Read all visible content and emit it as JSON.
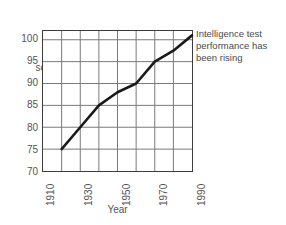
{
  "chart_data": {
    "type": "line",
    "title": "",
    "xlabel": "Year",
    "ylabel": "IQ score",
    "ylabel_line1": "IQ",
    "ylabel_line2": "score",
    "xlim": [
      1910,
      1990
    ],
    "ylim": [
      70,
      102
    ],
    "grid": true,
    "grid_x_step": 10,
    "grid_y_step": 5,
    "legend": "none",
    "x_ticks": [
      "1910",
      "1930",
      "1950",
      "1970",
      "1990"
    ],
    "x_tick_values": [
      1910,
      1930,
      1950,
      1970,
      1990
    ],
    "y_ticks": [
      "70",
      "75",
      "80",
      "85",
      "90",
      "95",
      "100"
    ],
    "y_tick_values": [
      70,
      75,
      80,
      85,
      90,
      95,
      100
    ],
    "x": [
      1920,
      1930,
      1940,
      1950,
      1960,
      1970,
      1980,
      1990
    ],
    "values": [
      75,
      80,
      85,
      88,
      90,
      95,
      97.5,
      101
    ],
    "series": [
      {
        "name": "IQ score",
        "color": "#1a1a1a",
        "x": [
          1920,
          1930,
          1940,
          1950,
          1960,
          1970,
          1980,
          1990
        ],
        "values": [
          75,
          80,
          85,
          88,
          90,
          95,
          97.5,
          101
        ]
      }
    ],
    "annotations": [
      {
        "text": "Intelligence test performance has been rising",
        "lines": [
          "Intelligence test",
          "performance has",
          "been rising"
        ],
        "position": "right"
      }
    ]
  },
  "annotation": {
    "line1": "Intelligence test",
    "line2": "performance has",
    "line3": "been rising"
  },
  "colors": {
    "line": "#1a1a1a",
    "grid": "#7a7a7a",
    "axis": "#3c3c3c",
    "text": "#555555",
    "background": "#ffffff"
  }
}
